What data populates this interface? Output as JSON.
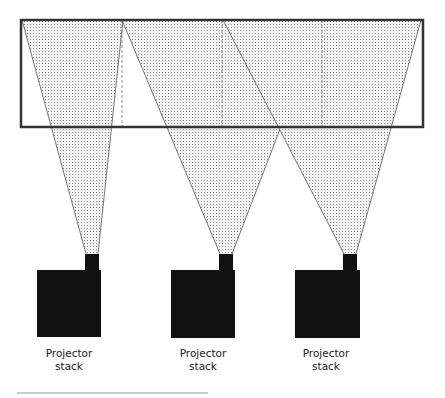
{
  "diagram": {
    "title": "",
    "screen": {
      "x": 21,
      "y": 20,
      "width": 402,
      "height": 107
    },
    "colors": {
      "outline": "#333333",
      "fill_dot": "#9a9a9a",
      "block": "#111111",
      "dash": "#777777"
    },
    "projectors": [
      {
        "label_line1": "Projector",
        "label_line2": "stack",
        "box": {
          "x": 37,
          "y": 270,
          "w": 64,
          "h": 67
        },
        "head": {
          "x": 85,
          "y": 254,
          "w": 14,
          "h": 16
        },
        "beam": {
          "left_top": 22,
          "right_top": 123,
          "apex_x": 92,
          "apex_y": 254
        },
        "label_cx": 69
      },
      {
        "label_line1": "Projector",
        "label_line2": "stack",
        "box": {
          "x": 171,
          "y": 270,
          "w": 64,
          "h": 68
        },
        "head": {
          "x": 219,
          "y": 254,
          "w": 14,
          "h": 16
        },
        "beam": {
          "left_top": 122,
          "right_top": 322,
          "apex_x": 226,
          "apex_y": 254
        },
        "label_cx": 203
      },
      {
        "label_line1": "Projector",
        "label_line2": "stack",
        "box": {
          "x": 295,
          "y": 270,
          "w": 65,
          "h": 68
        },
        "head": {
          "x": 343,
          "y": 254,
          "w": 14,
          "h": 16
        },
        "beam": {
          "left_top": 223,
          "right_top": 421,
          "apex_x": 350,
          "apex_y": 254
        },
        "label_cx": 326
      }
    ],
    "dashed_lines_x": [
      122,
      222,
      322
    ],
    "footer_rule": {
      "x1": 17,
      "x2": 208,
      "y": 393
    }
  }
}
